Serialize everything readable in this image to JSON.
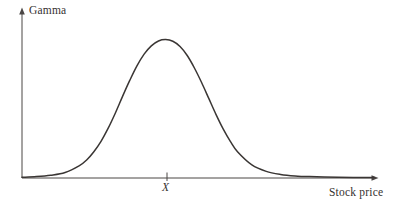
{
  "figure": {
    "background_color": "#ffffff",
    "line_color": "#3a3634",
    "axis_color": "#4a4644",
    "y_axis_label": "Gamma",
    "x_axis_label": "Stock price",
    "strike_tick_label": "X"
  },
  "chart_data": {
    "type": "line",
    "title": "",
    "subtitle": "",
    "xlabel": "Stock price",
    "ylabel": "Gamma",
    "grid": false,
    "legend": false,
    "annotations": [
      {
        "name": "strike-tick",
        "label": "X",
        "x": 1.0,
        "axis": "x",
        "description": "Strike price tick mark on the stock price axis, located at the peak of the gamma curve"
      }
    ],
    "axis_arrows": {
      "x": true,
      "y": true
    },
    "xlim": [
      0,
      2.45
    ],
    "ylim": [
      0,
      1.12
    ],
    "x_tick_labels": [
      "X"
    ],
    "y_tick_labels": [],
    "series": [
      {
        "name": "Gamma",
        "description": "Bell-shaped gamma profile peaking at the strike price X",
        "x": [
          0.0,
          0.1,
          0.2,
          0.3,
          0.4,
          0.45,
          0.5,
          0.55,
          0.6,
          0.65,
          0.7,
          0.75,
          0.8,
          0.85,
          0.9,
          0.95,
          1.0,
          1.05,
          1.1,
          1.15,
          1.2,
          1.25,
          1.3,
          1.35,
          1.4,
          1.45,
          1.5,
          1.6,
          1.7,
          1.8,
          1.9,
          2.0,
          2.2,
          2.45
        ],
        "y": [
          0.005,
          0.01,
          0.02,
          0.04,
          0.09,
          0.13,
          0.19,
          0.265,
          0.36,
          0.47,
          0.59,
          0.705,
          0.81,
          0.895,
          0.955,
          0.99,
          1.0,
          0.988,
          0.95,
          0.885,
          0.795,
          0.69,
          0.575,
          0.46,
          0.355,
          0.265,
          0.19,
          0.095,
          0.048,
          0.026,
          0.015,
          0.01,
          0.005,
          0.003
        ]
      }
    ]
  }
}
